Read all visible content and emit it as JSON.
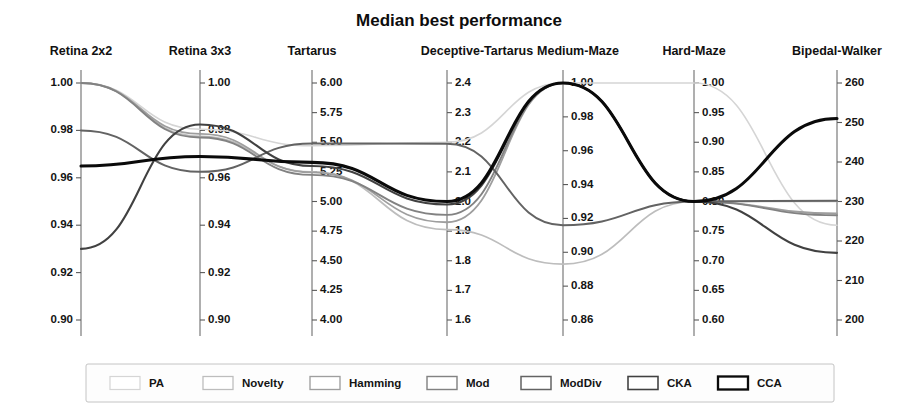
{
  "chart_data": {
    "type": "line",
    "subtype": "parallel-coordinates",
    "title": "Median best performance",
    "xlabel": "",
    "ylabel": "",
    "grid": false,
    "legend_position": "bottom",
    "axes": [
      {
        "name": "Retina 2x2",
        "min": 0.9,
        "max": 1.0,
        "ticks": [
          "1.00",
          "0.98",
          "0.96",
          "0.94",
          "0.92",
          "0.90"
        ],
        "tick_values": [
          1.0,
          0.98,
          0.96,
          0.94,
          0.92,
          0.9
        ],
        "label_side": "left"
      },
      {
        "name": "Retina 3x3",
        "min": 0.9,
        "max": 1.0,
        "ticks": [
          "1.00",
          "0.98",
          "0.96",
          "0.94",
          "0.92",
          "0.90"
        ],
        "tick_values": [
          1.0,
          0.98,
          0.96,
          0.94,
          0.92,
          0.9
        ],
        "label_side": "right"
      },
      {
        "name": "Tartarus",
        "min": 4.0,
        "max": 6.0,
        "ticks": [
          "6.00",
          "5.75",
          "5.50",
          "5.25",
          "5.00",
          "4.75",
          "4.50",
          "4.25",
          "4.00"
        ],
        "tick_values": [
          6.0,
          5.75,
          5.5,
          5.25,
          5.0,
          4.75,
          4.5,
          4.25,
          4.0
        ],
        "label_side": "right"
      },
      {
        "name": "Deceptive-Tartarus",
        "min": 1.6,
        "max": 2.4,
        "ticks": [
          "2.4",
          "2.3",
          "2.2",
          "2.1",
          "2.0",
          "1.9",
          "1.8",
          "1.7",
          "1.6"
        ],
        "tick_values": [
          2.4,
          2.3,
          2.2,
          2.1,
          2.0,
          1.9,
          1.8,
          1.7,
          1.6
        ],
        "label_side": "right"
      },
      {
        "name": "Medium-Maze",
        "min": 0.86,
        "max": 1.0,
        "ticks": [
          "1.00",
          "0.98",
          "0.96",
          "0.94",
          "0.92",
          "0.90",
          "0.88",
          "0.86"
        ],
        "tick_values": [
          1.0,
          0.98,
          0.96,
          0.94,
          0.92,
          0.9,
          0.88,
          0.86
        ],
        "label_side": "right"
      },
      {
        "name": "Hard-Maze",
        "min": 0.6,
        "max": 1.0,
        "ticks": [
          "1.00",
          "0.95",
          "0.90",
          "0.85",
          "0.80",
          "0.75",
          "0.70",
          "0.65",
          "0.60"
        ],
        "tick_values": [
          1.0,
          0.95,
          0.9,
          0.85,
          0.8,
          0.75,
          0.7,
          0.65,
          0.6
        ],
        "label_side": "right"
      },
      {
        "name": "Bipedal-Walker",
        "min": 200,
        "max": 260,
        "ticks": [
          "260",
          "250",
          "240",
          "230",
          "220",
          "210",
          "200"
        ],
        "tick_values": [
          260,
          250,
          240,
          230,
          220,
          210,
          200
        ],
        "label_side": "right"
      }
    ],
    "series": [
      {
        "name": "PA",
        "color": "#d5d5d5",
        "width": 1.6,
        "values": [
          1.0,
          0.9805,
          5.47,
          2.2,
          1.0,
          1.0,
          224.0
        ]
      },
      {
        "name": "Novelty",
        "color": "#bdbdbd",
        "width": 1.7,
        "values": [
          1.0,
          0.9775,
          5.25,
          1.905,
          0.893,
          0.8,
          230.0
        ]
      },
      {
        "name": "Hamming",
        "color": "#9e9e9e",
        "width": 1.8,
        "values": [
          1.0,
          0.9785,
          5.245,
          1.93,
          1.0,
          0.8,
          227.0
        ]
      },
      {
        "name": "Mod",
        "color": "#828282",
        "width": 1.9,
        "values": [
          1.0,
          0.977,
          5.225,
          1.955,
          1.0,
          0.8,
          226.5
        ]
      },
      {
        "name": "ModDiv",
        "color": "#636363",
        "width": 2.0,
        "values": [
          0.98,
          0.9625,
          5.49,
          2.195,
          0.916,
          0.8,
          230.2
        ]
      },
      {
        "name": "CKA",
        "color": "#414141",
        "width": 2.1,
        "values": [
          0.93,
          0.9825,
          5.3,
          1.99,
          1.0,
          0.8,
          217.0
        ]
      },
      {
        "name": "CCA",
        "color": "#0a0a0a",
        "width": 3.1,
        "values": [
          0.965,
          0.969,
          5.33,
          2.0,
          1.0,
          0.8,
          251.0
        ]
      }
    ]
  },
  "legend": {
    "entries": [
      {
        "label": "PA"
      },
      {
        "label": "Novelty"
      },
      {
        "label": "Hamming"
      },
      {
        "label": "Mod"
      },
      {
        "label": "ModDiv"
      },
      {
        "label": "CKA"
      },
      {
        "label": "CCA"
      }
    ]
  }
}
